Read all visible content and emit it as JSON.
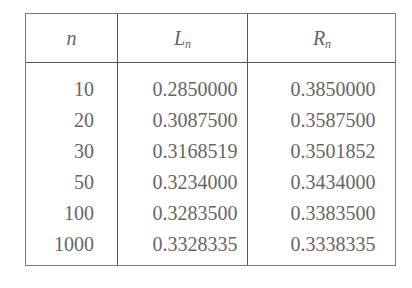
{
  "table": {
    "headers": {
      "n": "n",
      "L": {
        "base": "L",
        "sub": "n"
      },
      "R": {
        "base": "R",
        "sub": "n"
      }
    },
    "rows": [
      {
        "n": "10",
        "L": "0.2850000",
        "R": "0.3850000"
      },
      {
        "n": "20",
        "L": "0.3087500",
        "R": "0.3587500"
      },
      {
        "n": "30",
        "L": "0.3168519",
        "R": "0.3501852"
      },
      {
        "n": "50",
        "L": "0.3234000",
        "R": "0.3434000"
      },
      {
        "n": "100",
        "L": "0.3283500",
        "R": "0.3383500"
      },
      {
        "n": "1000",
        "L": "0.3328335",
        "R": "0.3338335"
      }
    ]
  }
}
